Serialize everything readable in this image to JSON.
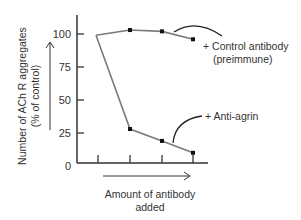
{
  "chart_data": {
    "type": "line",
    "title": "",
    "xlabel": "Amount of antibody added",
    "xlabel_lines": [
      "Amount of antibody",
      "added"
    ],
    "ylabel": "Number of AChR aggregates (% of control)",
    "ylabel_lines": [
      "Number of ACh R aggregates",
      "(% of control)"
    ],
    "ylim": [
      0,
      110
    ],
    "yticks": [
      0,
      25,
      50,
      75,
      100
    ],
    "ytick_labels": [
      "0",
      "25",
      "50",
      "75",
      "100"
    ],
    "x": [
      0,
      1,
      2,
      3
    ],
    "xtick_count": 4,
    "grid": false,
    "series": [
      {
        "name": "+ Control antibody (preimmune)",
        "label_lines": [
          "+ Control antibody",
          "(preimmune)"
        ],
        "values": [
          99,
          103,
          102,
          96
        ],
        "markers": [
          false,
          true,
          true,
          true
        ]
      },
      {
        "name": "+ Anti-agrin",
        "label_lines": [
          "+ Anti-agrin"
        ],
        "values": [
          99,
          28,
          19,
          10
        ],
        "markers": [
          false,
          true,
          true,
          true
        ]
      }
    ],
    "colors": {
      "axis": "#333333",
      "series_line": "#7a7a7a",
      "marker": "#111111",
      "text": "#333333"
    }
  }
}
